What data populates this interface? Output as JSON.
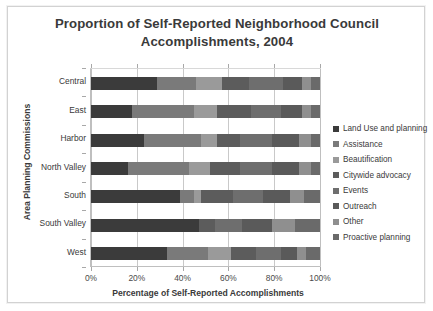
{
  "chart_data": {
    "type": "bar",
    "orientation": "horizontal",
    "stacked": true,
    "normalized": true,
    "title": "Proportion of Self-Reported Neighborhood Council Accomplishments, 2004",
    "title_lines": [
      "Proportion of Self-Reported Neighborhood Council",
      "Accomplishments, 2004"
    ],
    "xlabel": "Percentage of Self-Reported Accomplishments",
    "ylabel": "Area Planning Commissions",
    "xlim": [
      0,
      100
    ],
    "xticks": [
      0,
      20,
      40,
      60,
      80,
      100
    ],
    "xtick_labels": [
      "0%",
      "20%",
      "40%",
      "60%",
      "80%",
      "100%"
    ],
    "grid": "vertical",
    "legend_position": "right",
    "categories": [
      "Central",
      "East",
      "Harbor",
      "North Valley",
      "South",
      "South Valley",
      "West"
    ],
    "series": [
      {
        "name": "Land Use and planning",
        "color": "#3b3b3b",
        "values": [
          29,
          18,
          23,
          16,
          39,
          47,
          33
        ]
      },
      {
        "name": "Assistance",
        "color": "#7a7a7a",
        "values": [
          17,
          27,
          25,
          27,
          6,
          0,
          18
        ]
      },
      {
        "name": "Beautification",
        "color": "#9a9a9a",
        "values": [
          11,
          10,
          7,
          9,
          3,
          0,
          10
        ]
      },
      {
        "name": "Citywide advocacy",
        "color": "#5c5c5c",
        "values": [
          12,
          15,
          10,
          13,
          14,
          7,
          11
        ]
      },
      {
        "name": "Events",
        "color": "#6e6e6e",
        "values": [
          15,
          13,
          14,
          14,
          13,
          12,
          11
        ]
      },
      {
        "name": "Outreach",
        "color": "#5a5a5a",
        "values": [
          8,
          9,
          12,
          12,
          12,
          13,
          7
        ]
      },
      {
        "name": "Other",
        "color": "#8f8f8f",
        "values": [
          4,
          4,
          5,
          5,
          6,
          10,
          4
        ]
      },
      {
        "name": "Proactive planning",
        "color": "#6a6a6a",
        "values": [
          4,
          4,
          4,
          4,
          7,
          11,
          6
        ]
      }
    ]
  }
}
